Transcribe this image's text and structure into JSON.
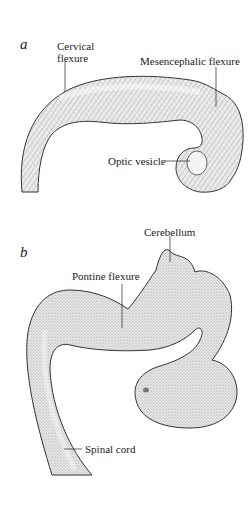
{
  "panels": [
    {
      "letter": "a",
      "labels": {
        "cervical_flexure_line1": "Cervical",
        "cervical_flexure_line2": "flexure",
        "mesencephalic_flexure": "Mesencephalic flexure",
        "optic_vesicle": "Optic vesicle"
      }
    },
    {
      "letter": "b",
      "labels": {
        "cerebellum": "Cerebellum",
        "pontine_flexure": "Pontine flexure",
        "spinal_cord": "Spinal cord"
      }
    }
  ],
  "colors": {
    "ink": "#222222",
    "fill": "#e6e6e6",
    "background": "#ffffff"
  }
}
